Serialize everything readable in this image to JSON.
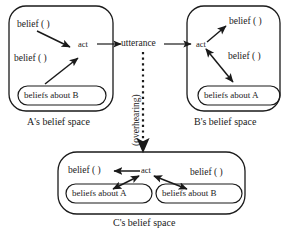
{
  "figure": {
    "type": "belief-space-diagram",
    "background_color": "#ffffff",
    "stroke_color": "#1a1a1a"
  },
  "spaces": {
    "a": {
      "caption": "A's belief space",
      "belief_top": "belief ( )",
      "belief_bottom": "belief ( )",
      "act": "act",
      "pill": "beliefs about B"
    },
    "b": {
      "caption": "B's belief space",
      "belief_top": "belief ( )",
      "belief_bottom": "belief ( )",
      "act": "act",
      "pill": "beliefs about A"
    },
    "c": {
      "caption": "C's belief space",
      "belief_left": "belief ( )",
      "belief_right": "belief ( )",
      "act": "act",
      "pill_left": "beliefs about A",
      "pill_right": "beliefs about B"
    }
  },
  "connectors": {
    "utterance_label": "utterance",
    "overhearing_label": "(overhearing)"
  }
}
